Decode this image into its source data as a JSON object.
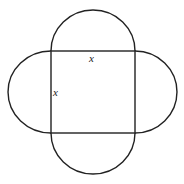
{
  "diagram": {
    "square": {
      "left": 51,
      "top": 51,
      "right": 135,
      "bottom": 133
    },
    "labels": {
      "top_side": "x",
      "left_side": "x"
    },
    "stroke_color": "#222222",
    "background": "#ffffff"
  }
}
